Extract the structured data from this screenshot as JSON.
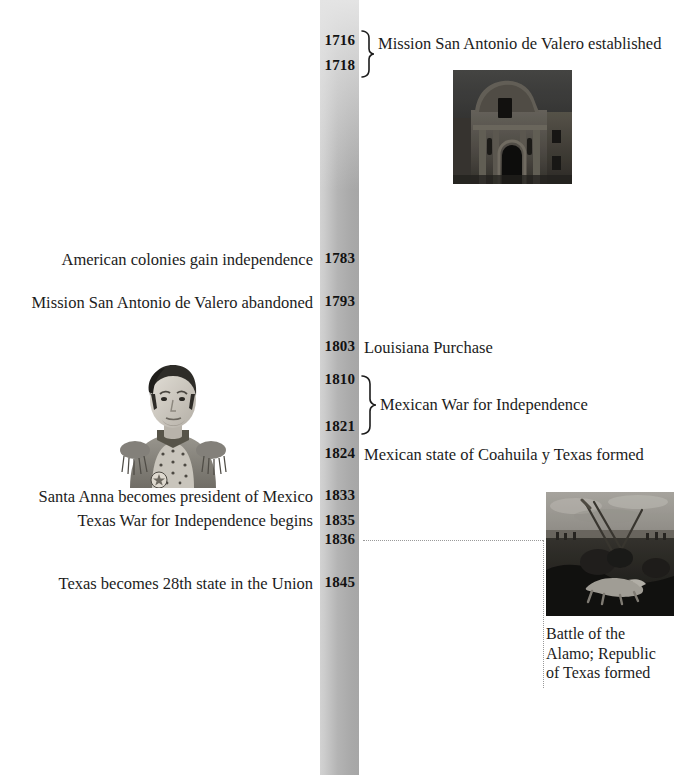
{
  "timeline": {
    "bar_color_top": "#e4e4e4",
    "bar_color_bottom": "#a6a6a6",
    "events": [
      {
        "year": "1716",
        "label": "Mission San Antonio de Valero established",
        "side": "right",
        "bracketed": true
      },
      {
        "year": "1718",
        "label": "",
        "side": "right",
        "bracketed": true
      },
      {
        "year": "1783",
        "label": "American colonies gain independence",
        "side": "left"
      },
      {
        "year": "1793",
        "label": "Mission San Antonio de Valero abandoned",
        "side": "left"
      },
      {
        "year": "1803",
        "label": "Louisiana Purchase",
        "side": "right"
      },
      {
        "year": "1810",
        "label": "Mexican War for Independence",
        "side": "right",
        "bracketed": true
      },
      {
        "year": "1821",
        "label": "",
        "side": "right",
        "bracketed": true
      },
      {
        "year": "1824",
        "label": "Mexican state of Coahuila y Texas formed",
        "side": "right"
      },
      {
        "year": "1833",
        "label": "Santa Anna becomes president of Mexico",
        "side": "left"
      },
      {
        "year": "1835",
        "label": "Texas War for Independence begins",
        "side": "left"
      },
      {
        "year": "1836",
        "label": "Battle of the Alamo; Republic of Texas formed",
        "side": "right",
        "leader": true
      },
      {
        "year": "1845",
        "label": "Texas becomes 28th state in the Union",
        "side": "left"
      }
    ]
  },
  "years": {
    "y1716": "1716",
    "y1718": "1718",
    "y1783": "1783",
    "y1793": "1793",
    "y1803": "1803",
    "y1810": "1810",
    "y1821": "1821",
    "y1824": "1824",
    "y1833": "1833",
    "y1835": "1835",
    "y1836": "1836",
    "y1845": "1845"
  },
  "labels": {
    "mission_established": "Mission San Antonio de Valero established",
    "american_independence": "American colonies gain independence",
    "mission_abandoned": "Mission San Antonio de Valero abandoned",
    "louisiana_purchase": "Louisiana Purchase",
    "mexican_war": "Mexican War for Independence",
    "coahuila_texas": "Mexican state of Coahuila y Texas formed",
    "santa_anna_president": "Santa Anna becomes president of Mexico",
    "texas_war_begins": "Texas War for Independence begins",
    "texas_28th_state": "Texas becomes 28th state in the Union"
  },
  "images": {
    "alamo_photo": {
      "name": "alamo-mission-photograph",
      "alt": "Photograph of the Alamo mission facade"
    },
    "santa_anna_portrait": {
      "name": "santa-anna-portrait",
      "alt": "Engraved portrait of Santa Anna in military uniform"
    },
    "battle_painting": {
      "name": "battle-of-the-alamo-painting",
      "alt": "Painting of the Battle of the Alamo"
    }
  },
  "captions": {
    "battle_line1": "Battle of the",
    "battle_line2": "Alamo; Republic",
    "battle_line3": "of Texas formed"
  }
}
